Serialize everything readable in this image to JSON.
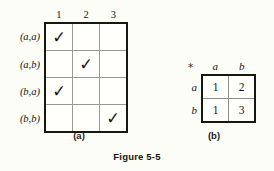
{
  "figure": {
    "caption": "Figure 5-5",
    "background_color": "#fdfdf8",
    "border_color": "#17170f",
    "gridline_color": "#9a9a93"
  },
  "panel_a": {
    "sublabel": "(a)",
    "corner_label": "",
    "column_headers": [
      "1",
      "2",
      "3"
    ],
    "row_labels": [
      "(a,a)",
      "(a,b)",
      "(b,a)",
      "(b,b)"
    ],
    "check_glyph": "✓",
    "rows": [
      {
        "label": "(a,a)",
        "cells": [
          "✓",
          "",
          ""
        ]
      },
      {
        "label": "(a,b)",
        "cells": [
          "",
          "✓",
          ""
        ]
      },
      {
        "label": "(b,a)",
        "cells": [
          "✓",
          "",
          ""
        ]
      },
      {
        "label": "(b,b)",
        "cells": [
          "",
          "",
          "✓"
        ]
      }
    ]
  },
  "panel_b": {
    "sublabel": "(b)",
    "corner_label": "∗",
    "column_headers": [
      "a",
      "b"
    ],
    "row_labels": [
      "a",
      "b"
    ],
    "rows": [
      {
        "label": "a",
        "cells": [
          "1",
          "2"
        ]
      },
      {
        "label": "b",
        "cells": [
          "1",
          "3"
        ]
      }
    ]
  }
}
